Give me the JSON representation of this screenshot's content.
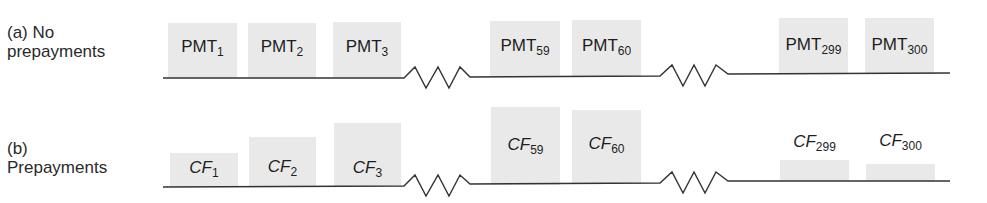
{
  "rows": [
    {
      "id": "a",
      "label_line1": "(a) No",
      "label_line2": "prepayments",
      "items": [
        {
          "base": "PMT",
          "sub": "1"
        },
        {
          "base": "PMT",
          "sub": "2"
        },
        {
          "base": "PMT",
          "sub": "3"
        },
        {
          "base": "PMT",
          "sub": "59"
        },
        {
          "base": "PMT",
          "sub": "60"
        },
        {
          "base": "PMT",
          "sub": "299"
        },
        {
          "base": "PMT",
          "sub": "300"
        }
      ]
    },
    {
      "id": "b",
      "label_line1": "(b)",
      "label_line2": "Prepayments",
      "items": [
        {
          "base": "CF",
          "sub": "1"
        },
        {
          "base": "CF",
          "sub": "2"
        },
        {
          "base": "CF",
          "sub": "3"
        },
        {
          "base": "CF",
          "sub": "59"
        },
        {
          "base": "CF",
          "sub": "60"
        },
        {
          "base": "CF",
          "sub": "299"
        },
        {
          "base": "CF",
          "sub": "300"
        }
      ]
    }
  ],
  "colors": {
    "box": "#e9e9e9",
    "line": "#333333"
  }
}
